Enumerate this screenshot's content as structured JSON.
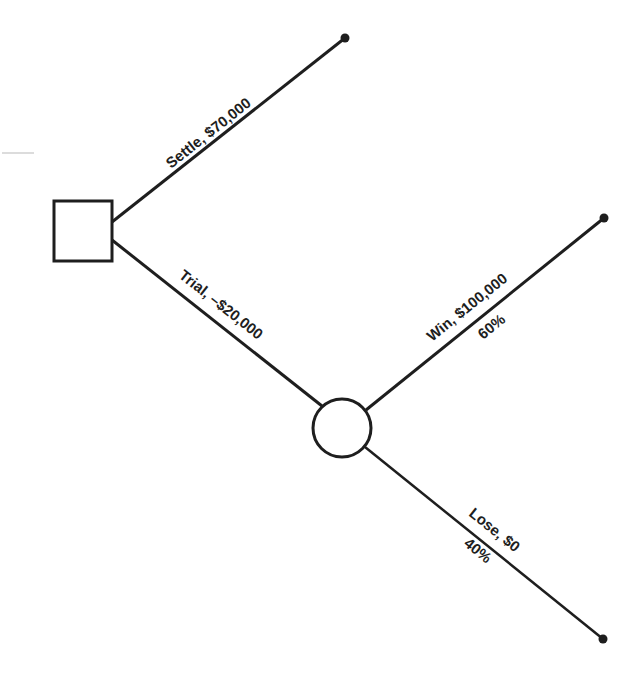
{
  "diagram": {
    "type": "decision-tree",
    "nodes": {
      "decision": {
        "shape": "square",
        "label": ""
      },
      "chance": {
        "shape": "circle",
        "label": ""
      }
    },
    "branches": {
      "settle": {
        "label": "Settle, $70,000"
      },
      "trial": {
        "label": "Trial, –$20,000"
      },
      "win": {
        "label": "Win, $100,000",
        "probability": "60%"
      },
      "lose": {
        "label": "Lose, $0",
        "probability": "40%"
      }
    },
    "colors": {
      "stroke": "#1e1e1e",
      "background": "#ffffff"
    }
  }
}
